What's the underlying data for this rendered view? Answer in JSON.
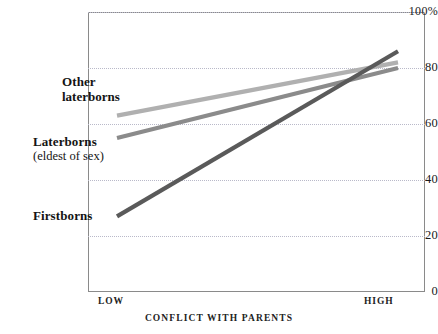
{
  "chart_data": {
    "type": "line",
    "title": "",
    "xlabel": "CONFLICT WITH PARENTS",
    "ylabel": "",
    "x": [
      "LOW",
      "HIGH"
    ],
    "categories": [
      "LOW",
      "HIGH"
    ],
    "ylim": [
      0,
      100
    ],
    "yticks": [
      "0",
      "20",
      "40",
      "60",
      "80",
      "100%"
    ],
    "ytick_values": [
      0,
      20,
      40,
      60,
      80,
      100
    ],
    "grid": "horizontal-dotted",
    "legend": "inline-labels",
    "series": [
      {
        "name": "Other laterborns",
        "label_line1": "Other",
        "label_line2": "laterborns",
        "values": [
          63,
          82
        ],
        "color": "#b0b0b0"
      },
      {
        "name": "Laterborns (eldest of sex)",
        "label_line1": "Laterborns",
        "label_line2": "(eldest of sex)",
        "values": [
          55,
          80
        ],
        "color": "#8b8b8b"
      },
      {
        "name": "Firstborns",
        "label_line1": "Firstborns",
        "label_line2": "",
        "values": [
          27,
          86
        ],
        "color": "#5a5a5a"
      }
    ]
  },
  "axis": {
    "y": {
      "t100": "100%",
      "t80": "80",
      "t60": "60",
      "t40": "40",
      "t20": "20",
      "t0": "0"
    },
    "x": {
      "low": "LOW",
      "high": "HIGH",
      "title": "CONFLICT WITH PARENTS"
    }
  },
  "labels": {
    "other_line1": "Other",
    "other_line2": "laterborns",
    "later_line1": "Laterborns",
    "later_line2": "(eldest of sex)",
    "first_line1": "Firstborns"
  },
  "colors": {
    "series_light": "#b0b0b0",
    "series_mid": "#8b8b8b",
    "series_dark": "#5a5a5a",
    "grid": "#b9b9c9",
    "frame": "#8a8a8a",
    "text": "#1a1a1a"
  }
}
